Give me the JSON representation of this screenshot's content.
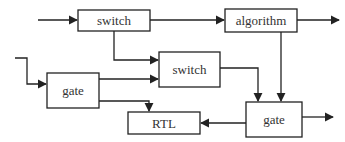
{
  "diagram": {
    "type": "block-diagram",
    "nodes": [
      {
        "id": "switch_top",
        "label": "switch"
      },
      {
        "id": "algorithm",
        "label": "algorithm"
      },
      {
        "id": "switch_mid",
        "label": "switch"
      },
      {
        "id": "gate_left",
        "label": "gate"
      },
      {
        "id": "rtl",
        "label": "RTL"
      },
      {
        "id": "gate_right",
        "label": "gate"
      }
    ],
    "edges": [
      {
        "from": "input",
        "to": "switch_top"
      },
      {
        "from": "switch_top",
        "to": "algorithm"
      },
      {
        "from": "algorithm",
        "to": "output"
      },
      {
        "from": "switch_top",
        "to": "switch_mid"
      },
      {
        "from": "input",
        "to": "gate_left"
      },
      {
        "from": "gate_left",
        "to": "switch_mid"
      },
      {
        "from": "gate_left",
        "to": "rtl"
      },
      {
        "from": "switch_mid",
        "to": "gate_right"
      },
      {
        "from": "algorithm",
        "to": "gate_right"
      },
      {
        "from": "gate_right",
        "to": "rtl"
      },
      {
        "from": "gate_right",
        "to": "output"
      }
    ]
  }
}
